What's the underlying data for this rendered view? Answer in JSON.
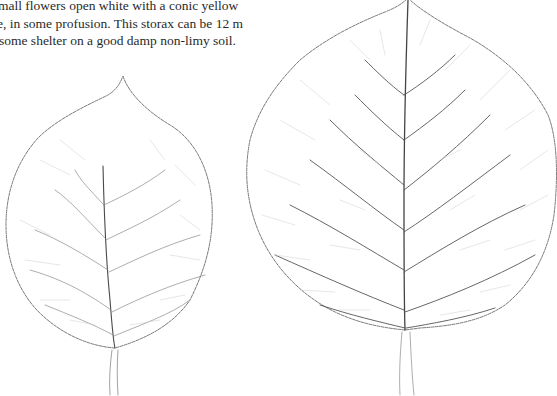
{
  "page": {
    "type": "scanned book page with botanical leaf illustrations",
    "background": "#ffffff"
  },
  "text": {
    "lines": [
      "mall flowers open white with a conic yellow",
      "e, in some profusion. This storax can be 12 m",
      " some shelter on a good damp non-limy soil."
    ],
    "color": "#2a2a2a"
  },
  "illustrations": [
    {
      "name": "small-leaf",
      "description": "ovate serrated leaf skeleton drawing with pointed tip and petiole"
    },
    {
      "name": "large-leaf",
      "description": "broad rounded serrated leaf skeleton drawing with pinnate veins and petiole"
    }
  ],
  "colors": {
    "ink": "#555555",
    "vein_light": "#b8b8b8",
    "midrib": "#444444"
  }
}
